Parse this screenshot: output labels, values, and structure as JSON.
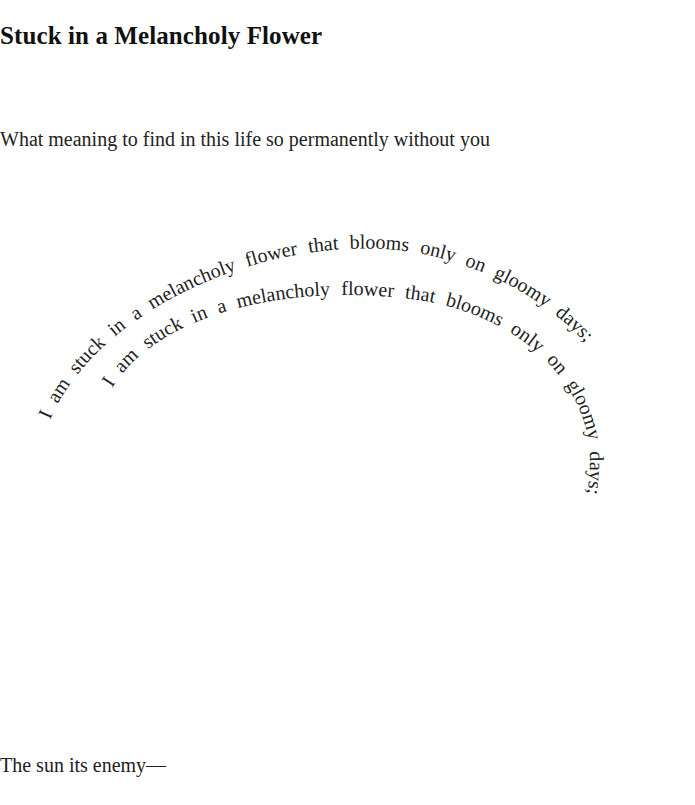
{
  "poem": {
    "title": "Stuck in a Melancholy Flower",
    "intro_line": "What meaning to find in this life so permanently without you",
    "spiral_outer": "I am stuck in a melancholy flower that blooms only on gloomy days;",
    "spiral_inner": "I am stuck in a melancholy flower that blooms only on gloomy days;",
    "closing_line": "The sun its enemy—"
  },
  "colors": {
    "text": "#222222",
    "background": "#ffffff"
  }
}
